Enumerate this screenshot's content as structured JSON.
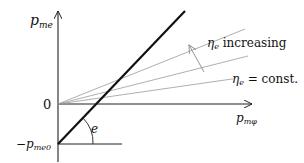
{
  "diagram": {
    "y_axis_label_main": "p",
    "y_axis_label_sub": "me",
    "x_axis_label_main": "p",
    "x_axis_label_sub": "mφ",
    "origin_label": "0",
    "intercept_label_prefix": "−p",
    "intercept_label_sub": "me0",
    "angle_label": "e",
    "annotation_increasing_symbol": "η",
    "annotation_increasing_sub": "e",
    "annotation_increasing_text": " increasing",
    "annotation_const_symbol": "η",
    "annotation_const_sub": "e",
    "annotation_const_text": " = const.",
    "colors": {
      "axis": "#222222",
      "thick_line": "#111111",
      "efficiency_lines": "#9a9a9a",
      "arrow": "#8a8a8a"
    }
  }
}
